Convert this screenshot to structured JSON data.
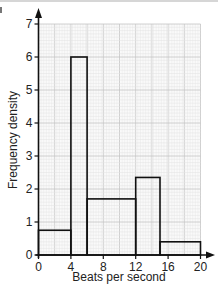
{
  "chart_data": {
    "type": "bar",
    "subtype": "histogram",
    "title": "",
    "xlabel": "Beats per second",
    "ylabel": "Frequency density",
    "xlim": [
      0,
      20
    ],
    "ylim": [
      0,
      7
    ],
    "x_ticks": [
      0,
      4,
      8,
      12,
      16,
      20
    ],
    "y_ticks": [
      0,
      1,
      2,
      3,
      4,
      5,
      6,
      7
    ],
    "grid": true,
    "legend": null,
    "bins": [
      {
        "from": 0,
        "to": 4,
        "frequency_density": 0.75
      },
      {
        "from": 4,
        "to": 6,
        "frequency_density": 6
      },
      {
        "from": 6,
        "to": 12,
        "frequency_density": 1.7
      },
      {
        "from": 12,
        "to": 15,
        "frequency_density": 2.35
      },
      {
        "from": 15,
        "to": 20,
        "frequency_density": 0.4
      }
    ],
    "categories": [
      "0-4",
      "4-6",
      "6-12",
      "12-15",
      "15-20"
    ],
    "values": [
      0.75,
      6,
      1.7,
      2.35,
      0.4
    ]
  },
  "labels": {
    "x_axis_title": "Beats per second",
    "y_axis_title": "Frequency density"
  },
  "colors": {
    "grid_minor": "#e3e3e3",
    "grid_major": "#c4c4c4",
    "axis": "#111111",
    "bar_stroke": "#111111",
    "bar_fill": "none"
  }
}
